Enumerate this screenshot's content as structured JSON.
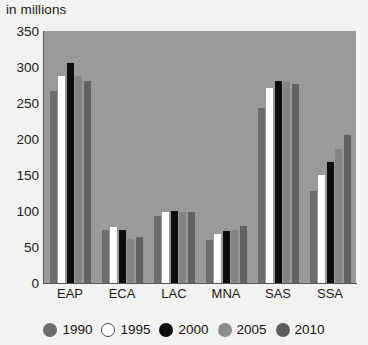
{
  "chart_data": {
    "type": "bar",
    "title": "",
    "subtitle": "",
    "unit_caption": "in millions",
    "xlabel": "",
    "ylabel": "",
    "ylim": [
      0,
      350
    ],
    "yticks": [
      350,
      300,
      250,
      200,
      150,
      100,
      50,
      0
    ],
    "ytick_labels": [
      "350",
      "300",
      "250",
      "200",
      "150",
      "100",
      "50",
      "0"
    ],
    "grid": false,
    "legend_position": "bottom",
    "categories": [
      "EAP",
      "ECA",
      "LAC",
      "MNA",
      "SAS",
      "SSA"
    ],
    "series": [
      {
        "name": "1990",
        "color": "#6d6d6d",
        "values": [
          267,
          74,
          93,
          60,
          243,
          128
        ]
      },
      {
        "name": "1995",
        "color": "#ffffff",
        "values": [
          288,
          78,
          98,
          68,
          271,
          150
        ]
      },
      {
        "name": "2000",
        "color": "#0d0d0d",
        "values": [
          305,
          73,
          100,
          72,
          280,
          168
        ]
      },
      {
        "name": "2005",
        "color": "#848484",
        "values": [
          287,
          61,
          99,
          74,
          279,
          186
        ]
      },
      {
        "name": "2010",
        "color": "#626262",
        "values": [
          280,
          64,
          99,
          79,
          276,
          205
        ]
      }
    ],
    "plot_background": "#9a9a9a",
    "page_background": "#f2f2f0"
  }
}
